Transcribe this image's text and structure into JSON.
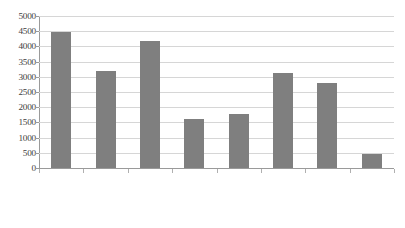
{
  "chart_data": {
    "type": "bar",
    "title": "",
    "subtitle": "",
    "xlabel": "",
    "ylabel": "",
    "categories": [
      "孔村",
      "孝直",
      "榆山办事处",
      "东阿镇",
      "安城乡",
      "锦水办事处",
      "玫瑰镇",
      "洪范池镇"
    ],
    "values": [
      4470,
      3180,
      4165,
      1615,
      1780,
      3140,
      2800,
      450
    ],
    "ylim": [
      0,
      5000
    ],
    "ytick_labels": [
      "5000",
      "4500",
      "4000",
      "3500",
      "3000",
      "2500",
      "2000",
      "1500",
      "1000",
      "500",
      "0"
    ],
    "ytick_values": [
      5000,
      4500,
      4000,
      3500,
      3000,
      2500,
      2000,
      1500,
      1000,
      500,
      0
    ],
    "ytick_step": 500,
    "grid": true,
    "grid_axis": "y",
    "legend": false,
    "legend_position": "none",
    "series": [
      {
        "name": "",
        "color": "#7f7f7f",
        "values": [
          4470,
          3180,
          4165,
          1615,
          1780,
          3140,
          2800,
          450
        ]
      }
    ],
    "colors": {
      "bar": "#7f7f7f",
      "gridline": "#d6d6d6",
      "axis": "#9a9a9a",
      "text": "#3c3c3c",
      "background": "#ffffff"
    },
    "x_label_rotation": -45
  }
}
